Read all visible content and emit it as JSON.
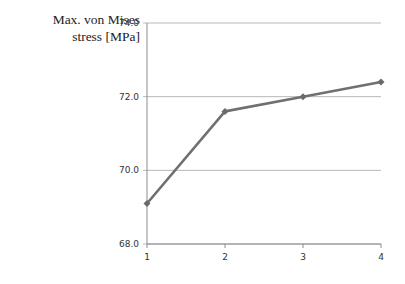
{
  "chart_data": {
    "type": "line",
    "title": "",
    "xlabel": "",
    "ylabel": "Max. von Mises stress [MPa]",
    "ylabel_lines": [
      "Max. von Mises",
      "stress [MPa]"
    ],
    "categories": [
      "1",
      "2",
      "3",
      "4"
    ],
    "x": [
      1,
      2,
      3,
      4
    ],
    "series": [
      {
        "name": "Max. von Mises stress",
        "values": [
          69.1,
          71.6,
          72.0,
          72.4
        ],
        "color": "#707070",
        "marker": "diamond"
      }
    ],
    "ylim": [
      68.0,
      74.0
    ],
    "yticks": [
      "68.0",
      "70.0",
      "72.0",
      "74.0"
    ],
    "grid": true,
    "legend": "none"
  }
}
